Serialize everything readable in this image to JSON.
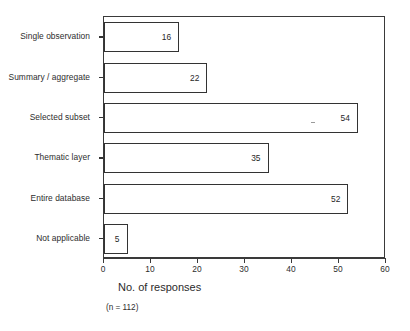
{
  "chart_data": {
    "type": "bar",
    "orientation": "horizontal",
    "title": "",
    "xlabel": "No. of responses",
    "ylabel": "",
    "footnote": "(n = 112)",
    "xlim": [
      0,
      60
    ],
    "xticks": [
      0,
      10,
      20,
      30,
      40,
      50,
      60
    ],
    "xtick_labels": [
      "0",
      "10",
      "20",
      "30",
      "40",
      "50",
      "60"
    ],
    "grid": false,
    "legend": false,
    "categories": [
      "Single observation",
      "Summary / aggregate",
      "Selected subset",
      "Thematic layer",
      "Entire database",
      "Not applicable"
    ],
    "values": [
      16,
      22,
      54,
      35,
      52,
      5
    ],
    "value_labels": [
      "16",
      "22",
      "54",
      "35",
      "52",
      "5"
    ],
    "bar_fill": "#ffffff",
    "bar_edge": "#333333",
    "axis_color": "#3a3a3a",
    "text_color": "#2b2b2b",
    "background": "#ffffff"
  }
}
